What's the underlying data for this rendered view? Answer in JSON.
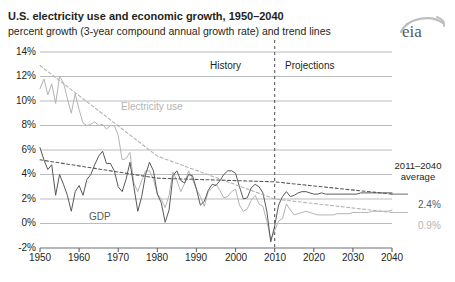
{
  "header": {
    "title": "U.S. electricity use and economic growth, 1950–2040",
    "subtitle": "percent growth (3-year compound annual growth rate) and trend lines",
    "logo_text": "eia"
  },
  "annotations": {
    "history_label": "History",
    "projections_label": "Projections",
    "electricity_series_label": "Electricity use",
    "gdp_series_label": "GDP",
    "average_header_line1": "2011–2040",
    "average_header_line2": "average",
    "gdp_average_value": "2.4%",
    "electricity_average_value": "0.9%"
  },
  "colors": {
    "gdp": "#58595b",
    "electricity": "#b3b3b3",
    "gridline": "#a7a9ac",
    "axis": "#6d6e71",
    "divider": "#58595b",
    "text": "#231f20"
  },
  "chart_data": {
    "type": "line",
    "title": "U.S. electricity use and economic growth, 1950–2040",
    "subtitle": "percent growth (3-year compound annual growth rate) and trend lines",
    "xlabel": "",
    "ylabel": "percent growth (3-year compound annual growth rate)",
    "xlim": [
      1950,
      2040
    ],
    "ylim": [
      -2,
      14
    ],
    "ytick_labels": [
      "14%",
      "12%",
      "10%",
      "8%",
      "6%",
      "4%",
      "2%",
      "0%",
      "-2%"
    ],
    "ytick_values": [
      14,
      12,
      10,
      8,
      6,
      4,
      2,
      0,
      -2
    ],
    "xtick_labels": [
      "1950",
      "1960",
      "1970",
      "1980",
      "1990",
      "2000",
      "2010",
      "2020",
      "2030",
      "2040"
    ],
    "xtick_values": [
      1950,
      1960,
      1970,
      1980,
      1990,
      2000,
      2010,
      2020,
      2030,
      2040
    ],
    "grid": true,
    "legend": "inline-labels",
    "history_projection_split": 2010,
    "series": [
      {
        "name": "Electricity use",
        "color": "#b3b3b3",
        "style": "solid",
        "x": [
          1950,
          1951,
          1952,
          1953,
          1954,
          1955,
          1956,
          1957,
          1958,
          1959,
          1960,
          1961,
          1962,
          1963,
          1964,
          1965,
          1966,
          1967,
          1968,
          1969,
          1970,
          1971,
          1972,
          1973,
          1974,
          1975,
          1976,
          1977,
          1978,
          1979,
          1980,
          1981,
          1982,
          1983,
          1984,
          1985,
          1986,
          1987,
          1988,
          1989,
          1990,
          1991,
          1992,
          1993,
          1994,
          1995,
          1996,
          1997,
          1998,
          1999,
          2000,
          2001,
          2002,
          2003,
          2004,
          2005,
          2006,
          2007,
          2008,
          2009,
          2010,
          2011,
          2012,
          2013,
          2014,
          2015,
          2016,
          2017,
          2018,
          2019,
          2020,
          2021,
          2022,
          2023,
          2024,
          2025,
          2026,
          2027,
          2028,
          2029,
          2030,
          2031,
          2032,
          2033,
          2034,
          2035,
          2036,
          2037,
          2038,
          2039,
          2040
        ],
        "values": [
          11.0,
          11.8,
          10.5,
          11.4,
          9.8,
          12.0,
          11.5,
          10.2,
          9.0,
          10.6,
          9.3,
          8.2,
          8.0,
          8.1,
          8.3,
          8.0,
          8.1,
          7.7,
          8.0,
          8.0,
          7.2,
          5.2,
          5.3,
          5.8,
          3.3,
          2.6,
          3.5,
          4.3,
          4.3,
          3.6,
          2.4,
          2.0,
          1.3,
          2.3,
          4.2,
          3.5,
          2.6,
          3.3,
          4.3,
          3.6,
          2.8,
          2.2,
          1.4,
          2.6,
          2.9,
          3.2,
          2.7,
          2.1,
          2.2,
          2.6,
          2.8,
          1.5,
          1.0,
          1.2,
          1.9,
          2.3,
          1.6,
          1.4,
          0.2,
          -1.3,
          -0.6,
          0.2,
          0.4,
          1.6,
          1.1,
          0.7,
          0.8,
          0.9,
          1.0,
          0.9,
          0.8,
          0.7,
          0.7,
          0.7,
          0.7,
          0.7,
          0.8,
          0.8,
          0.8,
          0.8,
          0.9,
          0.9,
          0.9,
          0.9,
          0.9,
          1.0,
          1.0,
          1.0,
          1.0,
          1.0,
          1.1
        ]
      },
      {
        "name": "GDP",
        "color": "#58595b",
        "style": "solid",
        "x": [
          1950,
          1951,
          1952,
          1953,
          1954,
          1955,
          1956,
          1957,
          1958,
          1959,
          1960,
          1961,
          1962,
          1963,
          1964,
          1965,
          1966,
          1967,
          1968,
          1969,
          1970,
          1971,
          1972,
          1973,
          1974,
          1975,
          1976,
          1977,
          1978,
          1979,
          1980,
          1981,
          1982,
          1983,
          1984,
          1985,
          1986,
          1987,
          1988,
          1989,
          1990,
          1991,
          1992,
          1993,
          1994,
          1995,
          1996,
          1997,
          1998,
          1999,
          2000,
          2001,
          2002,
          2003,
          2004,
          2005,
          2006,
          2007,
          2008,
          2009,
          2010,
          2011,
          2012,
          2013,
          2014,
          2015,
          2016,
          2017,
          2018,
          2019,
          2020,
          2021,
          2022,
          2023,
          2024,
          2025,
          2026,
          2027,
          2028,
          2029,
          2030,
          2031,
          2032,
          2033,
          2034,
          2035,
          2036,
          2037,
          2038,
          2039,
          2040
        ],
        "values": [
          6.2,
          5.2,
          4.4,
          4.8,
          2.3,
          4.0,
          3.2,
          2.3,
          1.0,
          2.6,
          3.1,
          2.3,
          3.6,
          4.0,
          4.8,
          5.5,
          5.9,
          4.9,
          4.9,
          4.3,
          3.0,
          2.6,
          3.6,
          5.0,
          3.0,
          1.0,
          2.2,
          4.0,
          5.0,
          4.3,
          2.4,
          1.7,
          0.1,
          1.1,
          3.9,
          4.3,
          3.5,
          3.3,
          4.0,
          3.9,
          2.8,
          1.5,
          1.8,
          2.7,
          3.2,
          3.1,
          3.5,
          4.0,
          4.3,
          4.3,
          4.1,
          3.0,
          2.0,
          2.1,
          2.9,
          3.2,
          3.0,
          2.5,
          1.0,
          -1.5,
          -0.2,
          1.5,
          2.2,
          2.6,
          2.2,
          2.3,
          2.5,
          2.6,
          2.6,
          2.5,
          2.4,
          2.4,
          2.5,
          2.4,
          2.4,
          2.4,
          2.4,
          2.4,
          2.4,
          2.4,
          2.4,
          2.4,
          2.5,
          2.5,
          2.5,
          2.5,
          2.5,
          2.5,
          2.5,
          2.5,
          2.5
        ]
      },
      {
        "name": "Electricity use trend",
        "color": "#b3b3b3",
        "style": "dashed",
        "x": [
          1950,
          1980,
          2010,
          2040
        ],
        "values": [
          12.9,
          5.5,
          2.0,
          0.9
        ]
      },
      {
        "name": "GDP trend",
        "color": "#58595b",
        "style": "dashed",
        "x": [
          1950,
          1980,
          2010,
          2040
        ],
        "values": [
          5.2,
          3.7,
          3.4,
          2.4
        ]
      }
    ]
  }
}
